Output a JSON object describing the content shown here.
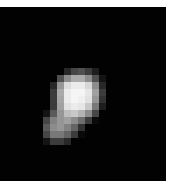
{
  "image": {
    "description": "Grayscale pixelated bright blob on black background",
    "background_color": "#020202",
    "border_color": "#ffffff",
    "pixel_size": 7,
    "origin": [
      43,
      68
    ],
    "grid": [
      [
        0,
        0,
        0,
        40,
        70,
        80,
        60,
        30,
        0
      ],
      [
        0,
        0,
        80,
        140,
        170,
        170,
        140,
        80,
        20
      ],
      [
        0,
        40,
        150,
        220,
        235,
        235,
        215,
        140,
        40
      ],
      [
        0,
        60,
        170,
        235,
        245,
        245,
        230,
        160,
        60
      ],
      [
        0,
        60,
        165,
        235,
        245,
        240,
        225,
        150,
        50
      ],
      [
        0,
        60,
        160,
        225,
        235,
        230,
        200,
        120,
        30
      ],
      [
        20,
        90,
        150,
        190,
        200,
        180,
        140,
        70,
        0
      ],
      [
        70,
        130,
        150,
        160,
        140,
        110,
        60,
        10,
        0
      ],
      [
        90,
        140,
        150,
        130,
        100,
        50,
        0,
        0,
        0
      ],
      [
        70,
        120,
        120,
        100,
        60,
        10,
        0,
        0,
        0
      ],
      [
        20,
        60,
        60,
        40,
        0,
        0,
        0,
        0,
        0
      ]
    ]
  }
}
